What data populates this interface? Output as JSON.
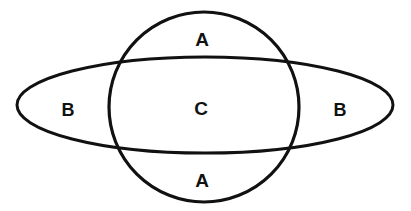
{
  "figure": {
    "type": "venn-diagram",
    "background_color": "#ffffff",
    "stroke_color": "#111111",
    "label_color": "#111111",
    "width": 411,
    "height": 211
  },
  "shapes": {
    "circle": {
      "name": "circle",
      "cx": 204,
      "cy": 107,
      "r": 95,
      "stroke_width": 3.2
    },
    "ellipse": {
      "name": "horizontal-lens-ellipse",
      "cx": 205,
      "cy": 105,
      "rx": 188,
      "ry": 48,
      "stroke_width": 3.0
    }
  },
  "labels": [
    {
      "text": "A",
      "region": "circle-top-lune",
      "x": 202,
      "y": 39
    },
    {
      "text": "B",
      "region": "ellipse-left-lune",
      "x": 68,
      "y": 110
    },
    {
      "text": "C",
      "region": "center-intersection",
      "x": 201,
      "y": 108
    },
    {
      "text": "B",
      "region": "ellipse-right-lune",
      "x": 340,
      "y": 110
    },
    {
      "text": "A",
      "region": "circle-bottom-lune",
      "x": 202,
      "y": 180
    }
  ]
}
